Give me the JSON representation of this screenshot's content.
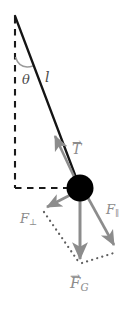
{
  "figure": {
    "type": "physics-force-diagram",
    "background_color": "#ffffff"
  },
  "colors": {
    "rod": "#1a1a1a",
    "bob": "#000000",
    "vector": "#8c8c8c",
    "dashed": "#1a1a1a",
    "dotted": "#6e6e6e",
    "arc": "#8c8c8c",
    "label_gray": "#8c8c8c",
    "label_dark": "#4a4a4a"
  },
  "geometry": {
    "pivot": {
      "x": 15,
      "y": 16
    },
    "bob": {
      "x": 80,
      "y": 188,
      "r": 13
    },
    "corner": {
      "x": 15,
      "y": 188
    },
    "fg_tip": {
      "x": 80,
      "y": 264
    },
    "fperp_tip": {
      "x": 45,
      "y": 209
    },
    "fpar_tip": {
      "x": 116,
      "y": 249
    },
    "tension_tip": {
      "x": 53,
      "y": 133
    }
  },
  "labels": {
    "theta": {
      "text": "θ",
      "x": 22,
      "y": 73
    },
    "length": {
      "text": "l",
      "x": 45,
      "y": 70
    },
    "tension": {
      "base": "T",
      "accent": "→",
      "x": 72,
      "y": 142
    },
    "force_perp": {
      "base": "F",
      "subscript": "⊥",
      "x": 20,
      "y": 212
    },
    "force_par": {
      "base": "F",
      "subscript": "∥",
      "x": 106,
      "y": 203
    },
    "force_gravity": {
      "base": "F",
      "subscript": "G",
      "accent": "→",
      "x": 72,
      "y": 276
    }
  },
  "elements": {
    "rod_name": "pendulum-rod",
    "bob_name": "pendulum-bob",
    "vertical_dashed_name": "vertical-reference-dashed-line",
    "horizontal_dashed_name": "horizontal-reference-dashed-line",
    "angle_arc_name": "angle-arc",
    "tension_vector_name": "tension-vector-arrow",
    "fperp_vector_name": "force-perpendicular-arrow",
    "fpar_vector_name": "force-parallel-arrow",
    "fg_vector_name": "force-gravity-arrow",
    "dotted_left_name": "dotted-construction-line-left",
    "dotted_right_name": "dotted-construction-line-right"
  }
}
